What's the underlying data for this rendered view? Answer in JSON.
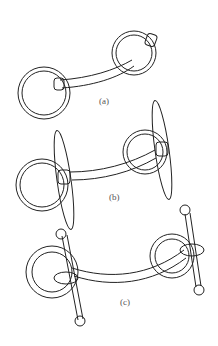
{
  "figure": {
    "panels": [
      {
        "id": "a",
        "label": "(a)"
      },
      {
        "id": "b",
        "label": "(b)"
      },
      {
        "id": "c",
        "label": "(c)"
      }
    ]
  },
  "colors": {
    "stroke": "#222222",
    "background": "#ffffff",
    "label": "#555555"
  }
}
